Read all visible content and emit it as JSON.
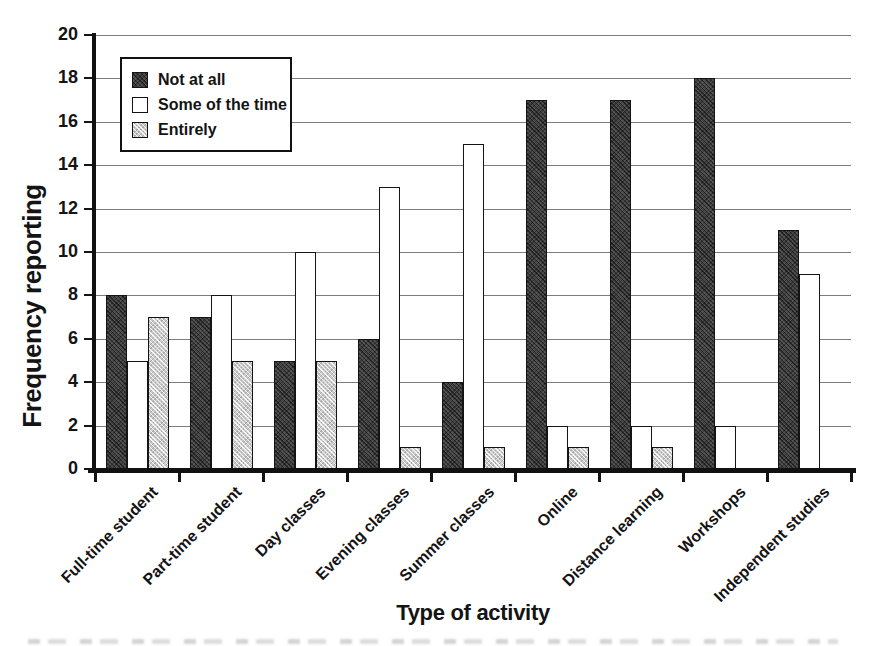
{
  "chart_data": {
    "type": "bar",
    "xlabel": "Type of activity",
    "ylabel": "Frequency reporting",
    "ylim": [
      0,
      20
    ],
    "ytick_step": 2,
    "grid": true,
    "legend_position": "top-left-inside",
    "categories": [
      "Full-time student",
      "Part-time student",
      "Day classes",
      "Evening classes",
      "Summer classes",
      "Online",
      "Distance learning",
      "Workshops",
      "Independent studies"
    ],
    "series": [
      {
        "name": "Not at all",
        "fill": "#484848",
        "pattern": "dark-crosshatch",
        "values": [
          8,
          7,
          5,
          6,
          4,
          17,
          17,
          18,
          11
        ]
      },
      {
        "name": "Some of the time",
        "fill": "#ffffff",
        "pattern": "plain",
        "values": [
          5,
          8,
          10,
          13,
          15,
          2,
          2,
          2,
          9
        ]
      },
      {
        "name": "Entirely",
        "fill": "#cacaca",
        "pattern": "light-crosshatch",
        "values": [
          7,
          5,
          5,
          1,
          1,
          1,
          1,
          0,
          0
        ]
      }
    ],
    "colors": {
      "axis": "#111111",
      "grid": "#7d7d7d",
      "text": "#141414",
      "background": "#ffffff"
    }
  }
}
